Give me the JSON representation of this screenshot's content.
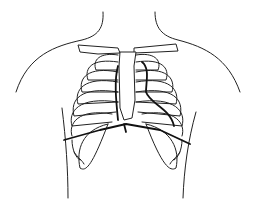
{
  "image": {
    "subject": "ribcage-line-drawing",
    "description": "Line drawing of a human torso outline with ribcage, sternum, clavicles and a dark line marking a boundary across the lower chest",
    "colors": {
      "background": "#ffffff",
      "line": "#222222"
    }
  }
}
